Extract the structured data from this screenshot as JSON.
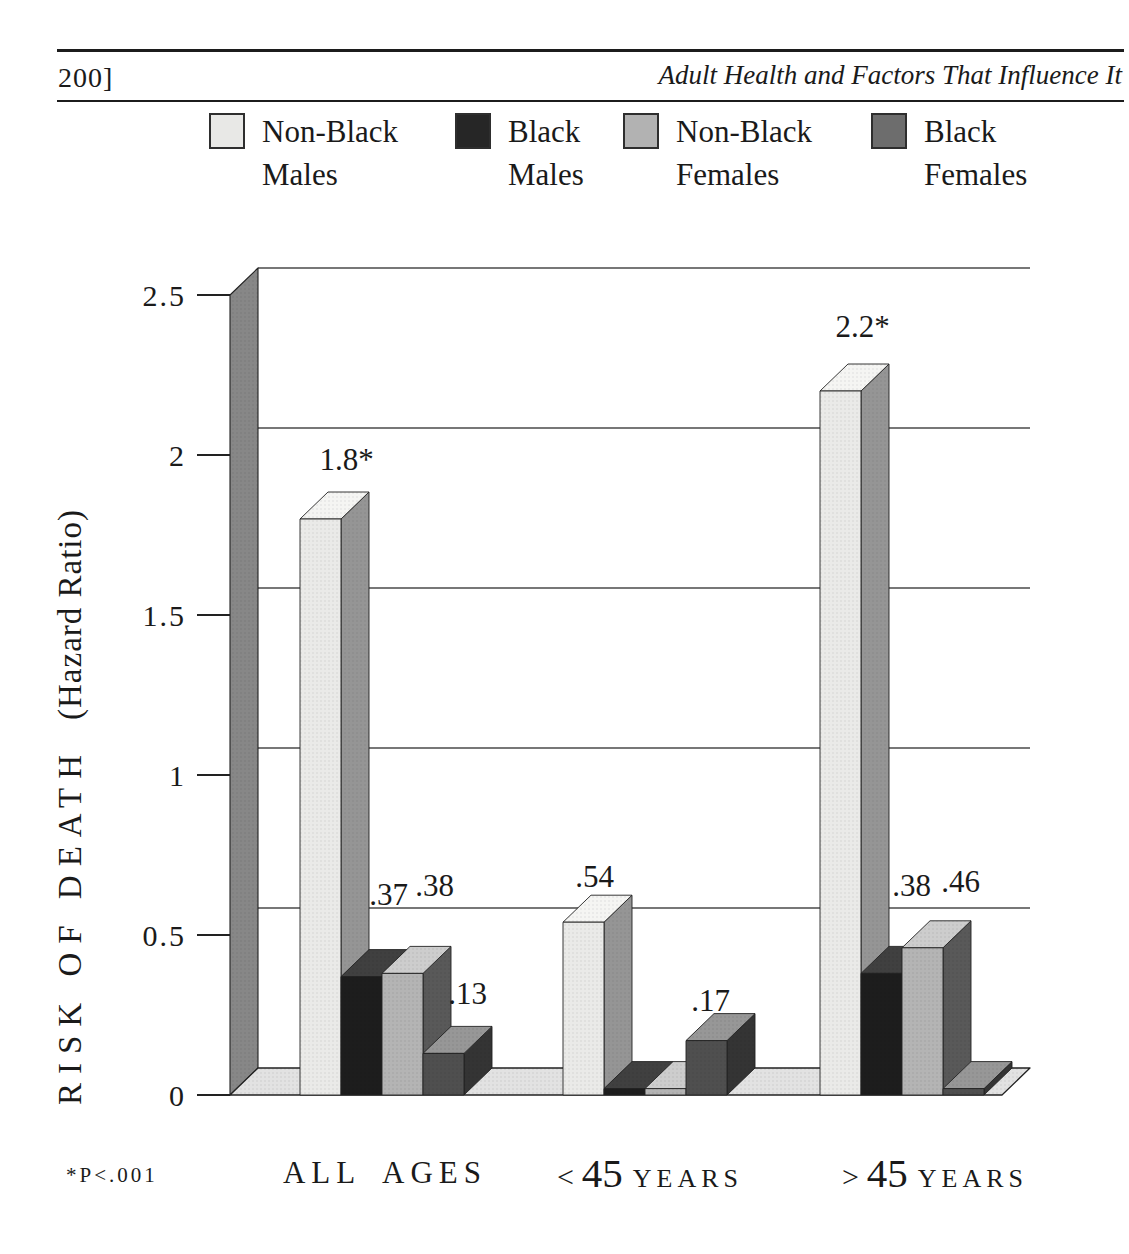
{
  "page": {
    "page_number": "200]",
    "running_title": "Adult Health and Factors That Influence It"
  },
  "legend": {
    "items": [
      {
        "line1": "Non-Black",
        "line2": "Males",
        "color": "#e8e8e6"
      },
      {
        "line1": "Black",
        "line2": "Males",
        "color": "#262626"
      },
      {
        "line1": "Non-Black",
        "line2": "Females",
        "color": "#b2b2b2"
      },
      {
        "line1": "Black",
        "line2": "Females",
        "color": "#6d6d6d"
      }
    ]
  },
  "y_axis": {
    "title_caps": "RISK OF DEATH",
    "title_paren": "(Hazard Ratio)"
  },
  "footnote": "*P<.001",
  "category_labels": [
    {
      "prefix": "",
      "number": "",
      "words": "ALL AGES"
    },
    {
      "prefix": "<",
      "number": "45",
      "words": "YEARS"
    },
    {
      "prefix": ">",
      "number": "45",
      "words": "YEARS"
    }
  ],
  "chart_data": {
    "type": "bar",
    "style": "3d-column",
    "title": "",
    "xlabel": "",
    "ylabel": "RISK OF DEATH (Hazard Ratio)",
    "ylim": [
      0,
      2.5
    ],
    "yticks": [
      0,
      0.5,
      1,
      1.5,
      2,
      2.5
    ],
    "ytick_labels": [
      "0",
      "0.5",
      "1",
      "1.5",
      "2",
      "2.5"
    ],
    "grid": true,
    "legend_position": "top",
    "categories": [
      "ALL AGES",
      "< 45 YEARS",
      "> 45 YEARS"
    ],
    "series": [
      {
        "name": "Non-Black Males",
        "values": [
          1.8,
          0.54,
          2.2
        ],
        "labels": [
          "1.8*",
          ".54",
          "2.2*"
        ]
      },
      {
        "name": "Black Males",
        "values": [
          0.37,
          0.02,
          0.38
        ],
        "labels": [
          ".37",
          "",
          ".38"
        ]
      },
      {
        "name": "Non-Black Females",
        "values": [
          0.38,
          0.02,
          0.46
        ],
        "labels": [
          ".38",
          "",
          ".46"
        ]
      },
      {
        "name": "Black Females",
        "values": [
          0.13,
          0.17,
          0.02
        ],
        "labels": [
          ".13",
          ".17",
          ""
        ]
      }
    ],
    "significance_note": "*P<.001",
    "colors": {
      "wall": "#878787",
      "floor": "#e2e2e2",
      "grid_line": "#4a4a4a",
      "axis_line": "#222222",
      "outline": "#222222",
      "series_faces": [
        {
          "front": "#eaeae8",
          "top": "#f5f5f3",
          "side": "#959595"
        },
        {
          "front": "#1d1d1d",
          "top": "#404040",
          "side": "#101010"
        },
        {
          "front": "#b4b4b4",
          "top": "#cdcdcd",
          "side": "#595959"
        },
        {
          "front": "#4f4f4f",
          "top": "#979797",
          "side": "#343434"
        }
      ]
    }
  }
}
